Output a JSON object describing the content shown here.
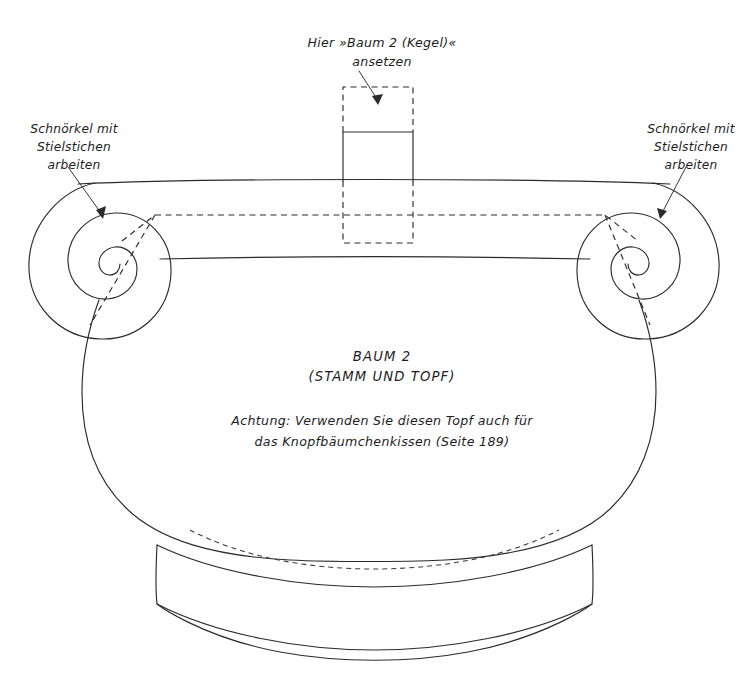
{
  "document": {
    "type": "sewing-embroidery-pattern-template",
    "page_background": "#ffffff",
    "line_color": "#2b2b2b"
  },
  "annotations": {
    "top_attach_label": {
      "name": "attach-cone-label",
      "lines": [
        "Hier »Baum 2 (Kegel)«",
        "ansetzen"
      ]
    },
    "left_scroll_label": {
      "name": "left-scroll-stitch-label",
      "lines": [
        "Schnörkel mit",
        "Stielstichen",
        "arbeiten"
      ]
    },
    "right_scroll_label": {
      "name": "right-scroll-stitch-label",
      "lines": [
        "Schnörkel mit",
        "Stielstichen",
        "arbeiten"
      ]
    },
    "center_title": {
      "name": "piece-title",
      "lines": [
        "BAUM 2",
        "(STAMM UND TOPF)"
      ]
    },
    "center_note": {
      "name": "reuse-note",
      "lines": [
        "Achtung: Verwenden Sie diesen Topf auch für",
        "das Knopfbäumchenkissen (Seite 189)"
      ]
    }
  },
  "shapes": {
    "pot_body": "pot-body-outline",
    "pot_rim_top": "pot-rim-top-edge",
    "pot_rim_bottom": "pot-rim-bottom-edge",
    "left_scroll": "left-scroll-spiral",
    "right_scroll": "right-scroll-spiral",
    "trunk_tab_solid": "trunk-attachment-tab",
    "trunk_tab_dashed": "trunk-seam-allowance-box",
    "rim_seam_dashed": "rim-seam-allowance-line",
    "foot_band": "pot-foot-band",
    "foot_seam_dashed": "foot-seam-allowance-arc"
  }
}
